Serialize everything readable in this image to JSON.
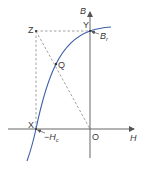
{
  "diagram": {
    "type": "hysteresis-loop-quadrant",
    "axes": {
      "vertical_label": "B",
      "horizontal_label": "H",
      "origin_label": "O"
    },
    "points": {
      "X": {
        "label": "X",
        "annotation": "−H",
        "annotation_sub": "c"
      },
      "Y": {
        "label": "Y",
        "annotation": "B",
        "annotation_sub": "r"
      },
      "Z": {
        "label": "Z"
      },
      "Q": {
        "label": "Q"
      }
    },
    "colors": {
      "curve": "#3b5ea8",
      "axes": "#555555",
      "dashed": "#777777",
      "text": "#3a3a3a",
      "background": "#ffffff"
    }
  }
}
